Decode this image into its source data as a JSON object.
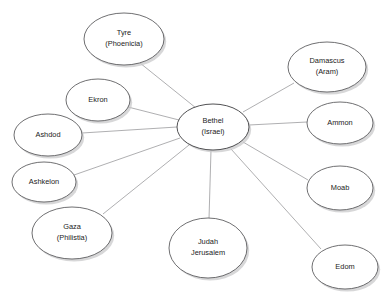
{
  "diagram": {
    "type": "hub-and-spoke node diagram",
    "background_color": "#ffffff",
    "node_fill_color": "#ffffff",
    "node_stroke_color": "#4a4a4c",
    "edge_color": "#8d8d8f",
    "shadow_color": "#c9c9cb",
    "text_color": "#1b1b1b",
    "hub": {
      "id": "bethel",
      "lines": [
        "Bethel",
        "(Israel)"
      ],
      "cx": 213,
      "cy": 127,
      "rx": 36,
      "ry": 23
    },
    "nodes": [
      {
        "id": "tyre",
        "lines": [
          "Tyre",
          "(Phoenicia)"
        ],
        "cx": 124,
        "cy": 39,
        "rx": 40,
        "ry": 26
      },
      {
        "id": "ekron",
        "lines": [
          "Ekron"
        ],
        "cx": 98,
        "cy": 100,
        "rx": 32,
        "ry": 21
      },
      {
        "id": "ashdod",
        "lines": [
          "Ashdod"
        ],
        "cx": 48,
        "cy": 135,
        "rx": 34,
        "ry": 21
      },
      {
        "id": "ashkelon",
        "lines": [
          "Ashkelon"
        ],
        "cx": 44,
        "cy": 182,
        "rx": 32,
        "ry": 20
      },
      {
        "id": "gaza",
        "lines": [
          "Gaza",
          "(Philistia)"
        ],
        "cx": 72,
        "cy": 233,
        "rx": 40,
        "ry": 26
      },
      {
        "id": "judah",
        "lines": [
          "Judah",
          "Jerusalem"
        ],
        "cx": 208,
        "cy": 248,
        "rx": 39,
        "ry": 30
      },
      {
        "id": "damascus",
        "lines": [
          "Damascus",
          "(Aram)"
        ],
        "cx": 327,
        "cy": 67,
        "rx": 39,
        "ry": 25
      },
      {
        "id": "ammon",
        "lines": [
          "Ammon"
        ],
        "cx": 340,
        "cy": 123,
        "rx": 33,
        "ry": 21
      },
      {
        "id": "moab",
        "lines": [
          "Moab"
        ],
        "cx": 340,
        "cy": 188,
        "rx": 33,
        "ry": 22
      },
      {
        "id": "edom",
        "lines": [
          "Edom"
        ],
        "cx": 345,
        "cy": 267,
        "rx": 33,
        "ry": 22
      }
    ],
    "edges": [
      {
        "from": "bethel",
        "to": "tyre",
        "x1": 196,
        "y1": 108,
        "x2": 140,
        "y2": 63
      },
      {
        "from": "bethel",
        "to": "ekron",
        "x1": 179,
        "y1": 120,
        "x2": 128,
        "y2": 107
      },
      {
        "from": "bethel",
        "to": "ashdod",
        "x1": 177,
        "y1": 127,
        "x2": 82,
        "y2": 133
      },
      {
        "from": "bethel",
        "to": "ashkelon",
        "x1": 180,
        "y1": 138,
        "x2": 74,
        "y2": 175
      },
      {
        "from": "bethel",
        "to": "gaza",
        "x1": 189,
        "y1": 145,
        "x2": 103,
        "y2": 214
      },
      {
        "from": "bethel",
        "to": "judah",
        "x1": 211,
        "y1": 150,
        "x2": 209,
        "y2": 219
      },
      {
        "from": "bethel",
        "to": "damascus",
        "x1": 243,
        "y1": 112,
        "x2": 294,
        "y2": 83
      },
      {
        "from": "bethel",
        "to": "ammon",
        "x1": 249,
        "y1": 125,
        "x2": 307,
        "y2": 122
      },
      {
        "from": "bethel",
        "to": "moab",
        "x1": 243,
        "y1": 142,
        "x2": 308,
        "y2": 180
      },
      {
        "from": "bethel",
        "to": "edom",
        "x1": 231,
        "y1": 149,
        "x2": 321,
        "y2": 249
      }
    ]
  }
}
